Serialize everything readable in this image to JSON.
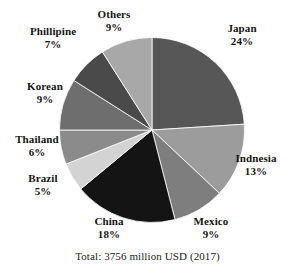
{
  "chart_data": {
    "type": "pie",
    "title": "",
    "subtitle": "",
    "xlabel": "",
    "ylabel": "",
    "legend_position": "outside-labels",
    "grid": false,
    "start_angle_deg": 0,
    "direction": "clockwise",
    "unit": "%",
    "categories": [
      "Japan",
      "Indnesia",
      "Mexico",
      "China",
      "Brazil",
      "Thailand",
      "Korean",
      "Phillipine",
      "Others"
    ],
    "values": [
      24,
      13,
      9,
      18,
      5,
      6,
      9,
      7,
      9
    ],
    "slices": [
      {
        "label": "Japan",
        "percent": 24,
        "percent_text": "24%",
        "color": "#575757"
      },
      {
        "label": "Indnesia",
        "percent": 13,
        "percent_text": "13%",
        "color": "#9c9c9c"
      },
      {
        "label": "Mexico",
        "percent": 9,
        "percent_text": "9%",
        "color": "#7e7e7e"
      },
      {
        "label": "China",
        "percent": 18,
        "percent_text": "18%",
        "color": "#141414"
      },
      {
        "label": "Brazil",
        "percent": 5,
        "percent_text": "5%",
        "color": "#d3d3d3"
      },
      {
        "label": "Thailand",
        "percent": 6,
        "percent_text": "6%",
        "color": "#8b8b8b"
      },
      {
        "label": "Korean",
        "percent": 9,
        "percent_text": "9%",
        "color": "#6e6e6e"
      },
      {
        "label": "Phillipine",
        "percent": 7,
        "percent_text": "7%",
        "color": "#4a4a4a"
      },
      {
        "label": "Others",
        "percent": 9,
        "percent_text": "9%",
        "color": "#a8a8a8"
      }
    ],
    "caption": "Total: 3756 million USD (2017)"
  },
  "labels": {
    "japan": {
      "name": "Japan",
      "pct": "24%"
    },
    "indnesia": {
      "name": "Indnesia",
      "pct": "13%"
    },
    "mexico": {
      "name": "Mexico",
      "pct": "9%"
    },
    "china": {
      "name": "China",
      "pct": "18%"
    },
    "brazil": {
      "name": "Brazil",
      "pct": "5%"
    },
    "thailand": {
      "name": "Thailand",
      "pct": "6%"
    },
    "korean": {
      "name": "Korean",
      "pct": "9%"
    },
    "phillipine": {
      "name": "Phillipine",
      "pct": "7%"
    },
    "others": {
      "name": "Others",
      "pct": "9%"
    }
  },
  "caption": "Total: 3756 million USD (2017)"
}
